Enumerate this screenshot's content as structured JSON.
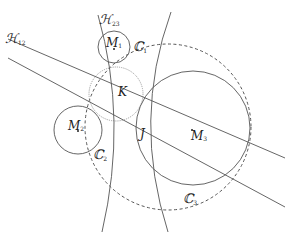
{
  "diagram": {
    "labels": {
      "H12": {
        "main": "ℋ",
        "sub": "12"
      },
      "H23": {
        "main": "ℋ",
        "sub": "23"
      },
      "M1": {
        "main": "M",
        "sub": "1"
      },
      "M2": {
        "main": "M",
        "sub": "2"
      },
      "M3": {
        "main": "M",
        "sub": "3"
      },
      "C1": {
        "main": "ℂ",
        "sub": "1"
      },
      "C2": {
        "main": "ℂ",
        "sub": "2"
      },
      "C3": {
        "main": "ℂ",
        "sub": "3"
      },
      "K": "K",
      "J": "J"
    },
    "colors": {
      "stroke": "#555555",
      "dotted_circle": "#999999",
      "text": "#222222"
    },
    "elements": {
      "outer_circle": {
        "cx": 168,
        "cy": 127,
        "r": 83,
        "style": "dashed"
      },
      "C1": {
        "cx": 114,
        "cy": 47,
        "r": 16
      },
      "C2": {
        "cx": 78,
        "cy": 130,
        "r": 24
      },
      "C3": {
        "cx": 193,
        "cy": 128,
        "r": 57
      },
      "K_circle": {
        "cx": 116,
        "cy": 94,
        "r": 27,
        "style": "dotted"
      },
      "line_H12": {
        "x1": 8,
        "y1": 39,
        "x2": 285,
        "y2": 158
      },
      "line_2": {
        "x1": 8,
        "y1": 58,
        "x2": 285,
        "y2": 207
      }
    }
  }
}
